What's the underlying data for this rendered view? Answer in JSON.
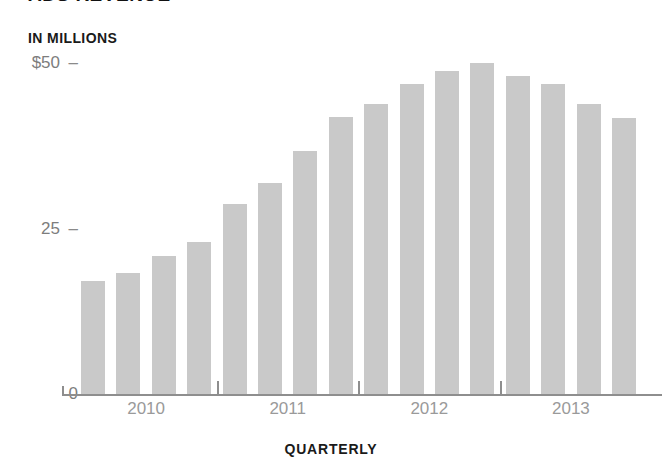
{
  "headline": "ADS REVENUE",
  "axes": {
    "y_unit_caption": "IN MILLIONS",
    "x_axis_title": "QUARTERLY",
    "y_ticks": [
      {
        "label": "$50",
        "value": 50
      },
      {
        "label": "25",
        "value": 25
      },
      {
        "label": "0",
        "value": 0
      }
    ],
    "x_tick_labels": [
      "2010",
      "2011",
      "2012",
      "2013"
    ]
  },
  "colors": {
    "bar_fill": "#c9c9c9",
    "axis_line": "#8e8e8e",
    "tick_text": "#9a9a9a",
    "y_tick_text": "#7d7d7d",
    "caption_text": "#1a1a1a",
    "background": "#ffffff"
  },
  "chart_data": {
    "type": "bar",
    "title": "ADS REVENUE",
    "xlabel": "QUARTERLY",
    "ylabel": "IN MILLIONS",
    "ylim": [
      0,
      50
    ],
    "yticks": [
      0,
      25,
      50
    ],
    "ytick_labels": [
      "0",
      "25",
      "$50"
    ],
    "grid": false,
    "legend": false,
    "units": "millions of dollars",
    "categories": [
      "2010 Q1",
      "2010 Q2",
      "2010 Q3",
      "2010 Q4",
      "2011 Q1",
      "2011 Q2",
      "2011 Q3",
      "2011 Q4",
      "2012 Q1",
      "2012 Q2",
      "2012 Q3",
      "2012 Q4",
      "2013 Q1",
      "2013 Q2",
      "2013 Q3",
      "2013 Q4"
    ],
    "values": [
      17.0,
      18.3,
      20.8,
      23.0,
      28.7,
      31.9,
      36.7,
      41.8,
      43.8,
      46.8,
      48.8,
      50.0,
      48.0,
      46.8,
      43.8,
      41.7
    ],
    "group_labels": [
      "2010",
      "2011",
      "2012",
      "2013"
    ],
    "bars_per_group": 4
  }
}
